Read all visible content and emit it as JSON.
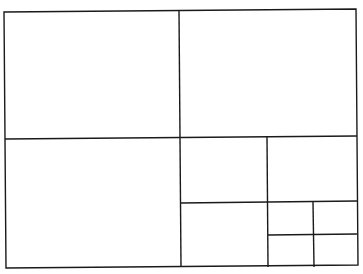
{
  "diagram": {
    "type": "rectangle-subdivision",
    "stroke_color": "#1a1a1a",
    "background_color": "#ffffff",
    "stroke_width": 1.4,
    "outer": {
      "x1": 5,
      "y1": 11,
      "x2": 357,
      "y2": 267
    },
    "lines": [
      {
        "id": "main-vertical",
        "x1": 179,
        "y1": 11,
        "x2": 181,
        "y2": 267
      },
      {
        "id": "main-horizontal",
        "x1": 5,
        "y1": 139,
        "x2": 357,
        "y2": 136
      },
      {
        "id": "right-vertical",
        "x1": 267,
        "y1": 137,
        "x2": 268,
        "y2": 267
      },
      {
        "id": "right-horizontal",
        "x1": 180,
        "y1": 203,
        "x2": 357,
        "y2": 201
      },
      {
        "id": "small-vertical",
        "x1": 313,
        "y1": 202,
        "x2": 314,
        "y2": 267
      },
      {
        "id": "small-horizontal",
        "x1": 268,
        "y1": 235,
        "x2": 357,
        "y2": 234
      }
    ],
    "cells": [
      {
        "name": "top-left",
        "x": 5,
        "y": 11,
        "w": 175,
        "h": 127
      },
      {
        "name": "top-right",
        "x": 180,
        "y": 10,
        "w": 177,
        "h": 127
      },
      {
        "name": "bottom-left",
        "x": 5,
        "y": 139,
        "w": 175,
        "h": 128
      },
      {
        "name": "mid-right-a",
        "x": 180,
        "y": 137,
        "w": 87,
        "h": 65
      },
      {
        "name": "mid-right-b",
        "x": 268,
        "y": 137,
        "w": 89,
        "h": 65
      },
      {
        "name": "bottom-mid",
        "x": 181,
        "y": 202,
        "w": 87,
        "h": 65
      },
      {
        "name": "tiny-top-left",
        "x": 268,
        "y": 202,
        "w": 45,
        "h": 33
      },
      {
        "name": "tiny-top-right",
        "x": 314,
        "y": 202,
        "w": 43,
        "h": 33
      },
      {
        "name": "tiny-bottom-left",
        "x": 268,
        "y": 235,
        "w": 45,
        "h": 32
      },
      {
        "name": "tiny-bottom-right",
        "x": 314,
        "y": 235,
        "w": 43,
        "h": 32
      }
    ]
  }
}
